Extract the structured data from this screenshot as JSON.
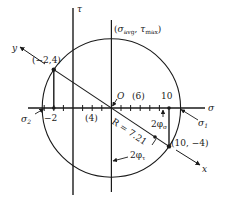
{
  "figure": {
    "axes": {
      "sigma_label": "σ",
      "tau_label": "τ"
    },
    "points": {
      "a": {
        "label": "(−2,4)",
        "sigma": -2,
        "tau": 4
      },
      "b": {
        "label": "(10, −4)",
        "sigma": 10,
        "tau": -4
      }
    },
    "center": {
      "label": "O",
      "sigma": 4
    },
    "top_point_label": "(σavg, τmax)",
    "top_point_sigma_sym": "σ",
    "top_point_sigma_sub": "avg",
    "top_point_tau_sym": "τ",
    "top_point_tau_sub": "max",
    "tick_labels": {
      "minus_two": "−2",
      "ten": "10",
      "span_left": "(4)",
      "span_right": "(6)"
    },
    "principal": {
      "sigma1_sym": "σ",
      "sigma1_sub": "1",
      "sigma2_sym": "σ",
      "sigma2_sub": "2"
    },
    "radius_label": "R = 7.21",
    "angle_sigma": {
      "sym": "2φ",
      "sub": "σ"
    },
    "angle_tau": {
      "sym": "2φ",
      "sub": "τ"
    },
    "rotated_axes": {
      "x_label": "x",
      "y_label": "y"
    },
    "colors": {
      "ink": "#1a1a1a",
      "background": "#ffffff"
    }
  }
}
